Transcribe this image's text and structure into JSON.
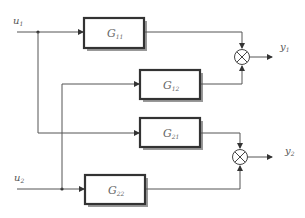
{
  "diagram": {
    "type": "MIMO block diagram (two-input two-output system)",
    "inputs": [
      {
        "id": "u1",
        "symbol": "u",
        "subscript": "1"
      },
      {
        "id": "u2",
        "symbol": "u",
        "subscript": "2"
      }
    ],
    "outputs": [
      {
        "id": "y1",
        "symbol": "y",
        "subscript": "1"
      },
      {
        "id": "y2",
        "symbol": "y",
        "subscript": "2"
      }
    ],
    "blocks": [
      {
        "id": "G11",
        "symbol": "G",
        "subscript": "11",
        "from": "u1",
        "to": "sum1"
      },
      {
        "id": "G12",
        "symbol": "G",
        "subscript": "12",
        "from": "u2",
        "to": "sum1"
      },
      {
        "id": "G21",
        "symbol": "G",
        "subscript": "21",
        "from": "u1",
        "to": "sum2"
      },
      {
        "id": "G22",
        "symbol": "G",
        "subscript": "22",
        "from": "u2",
        "to": "sum2"
      }
    ],
    "summing_junctions": [
      {
        "id": "sum1",
        "symbol": "⊗",
        "output": "y1"
      },
      {
        "id": "sum2",
        "symbol": "⊗",
        "output": "y2"
      }
    ],
    "colors": {
      "line": "#555555",
      "block_border": "#333333",
      "block_shadow": "#888888",
      "text": "#666666"
    }
  }
}
